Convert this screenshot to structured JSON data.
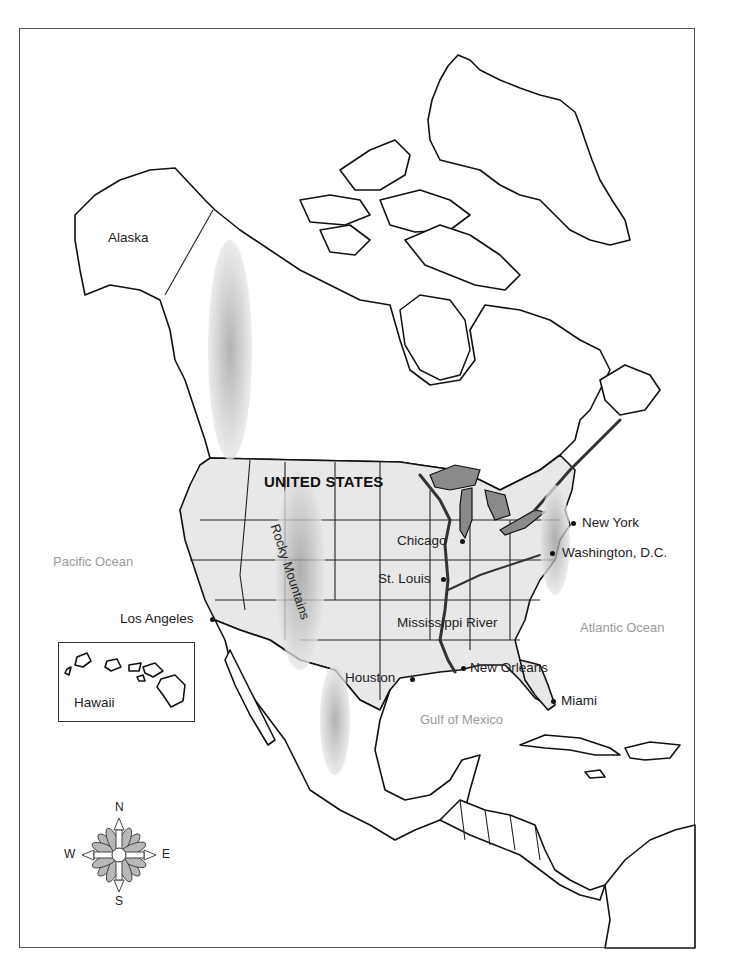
{
  "map": {
    "title": "North America",
    "regions": {
      "alaska": "Alaska",
      "united_states": "UNITED STATES",
      "hawaii": "Hawaii",
      "rocky_mountains": "Rocky Mountains"
    },
    "water_bodies": {
      "pacific": "Pacific Ocean",
      "atlantic": "Atlantic Ocean",
      "gulf": "Gulf of Mexico",
      "mississippi": "Mississippi River"
    },
    "cities": [
      {
        "name": "Los Angeles"
      },
      {
        "name": "Chicago"
      },
      {
        "name": "St. Louis"
      },
      {
        "name": "New York"
      },
      {
        "name": "Washington, D.C."
      },
      {
        "name": "New Orleans"
      },
      {
        "name": "Houston"
      },
      {
        "name": "Miami"
      }
    ],
    "compass": {
      "n": "N",
      "s": "S",
      "e": "E",
      "w": "W"
    },
    "colors": {
      "outline": "#111111",
      "us_fill": "#e8e8e8",
      "lakes": "#8a8a8a",
      "ocean_label": "#9a9a9a",
      "frame": "#555555"
    }
  }
}
